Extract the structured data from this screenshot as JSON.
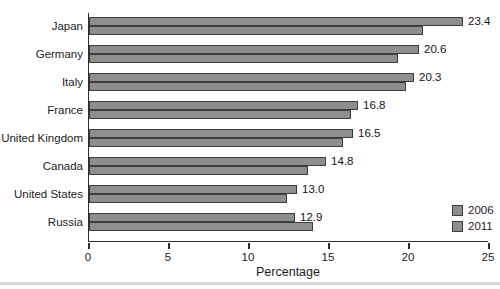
{
  "chart_data": {
    "type": "bar",
    "orientation": "horizontal",
    "xlabel": "Percentage",
    "xlim": [
      0,
      25
    ],
    "xticks": [
      0,
      5,
      10,
      15,
      20,
      25
    ],
    "categories": [
      "Japan",
      "Germany",
      "Italy",
      "France",
      "United Kingdom",
      "Canada",
      "United States",
      "Russia"
    ],
    "series": [
      {
        "name": "2011",
        "position_in_group": "top",
        "values": [
          23.4,
          20.6,
          20.3,
          16.8,
          16.5,
          14.8,
          13.0,
          12.9
        ],
        "data_labels": [
          "23.4",
          "20.6",
          "20.3",
          "16.8",
          "16.5",
          "14.8",
          "13.0",
          "12.9"
        ]
      },
      {
        "name": "2006",
        "position_in_group": "bottom",
        "values": [
          20.9,
          19.3,
          19.8,
          16.4,
          15.9,
          13.7,
          12.4,
          14.0
        ]
      }
    ],
    "legend": {
      "position": "right-bottom",
      "entries": [
        "2006",
        "2011"
      ]
    },
    "grid": false,
    "colors": {
      "bar_fill": "#8e8e8e",
      "bar_border": "#3d3d3d",
      "axis": "#2e2e2e",
      "text": "#1c1c1c",
      "bottom_rule": "#d8d8d8"
    }
  }
}
